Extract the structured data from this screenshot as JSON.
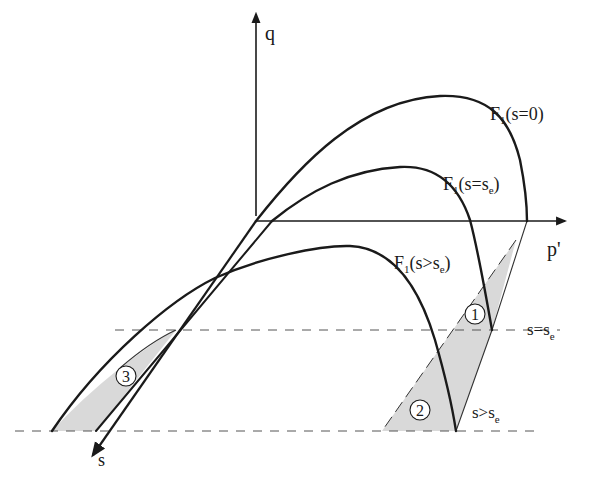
{
  "figure": {
    "type": "yield-surface-diagram",
    "axes": {
      "q_label": "q",
      "p_label": "p'",
      "s_label": "s"
    },
    "curves": [
      {
        "name": "F1(s=0)",
        "label_main": "F",
        "label_sub": "1",
        "label_rest": "(s=0)"
      },
      {
        "name": "F1(s=se)",
        "label_main": "F",
        "label_sub": "1",
        "label_rest_a": "(s=s",
        "label_rest_sub": "e",
        "label_rest_b": ")"
      },
      {
        "name": "F1(s>se)",
        "label_main": "F",
        "label_sub": "1",
        "label_rest_a": "(s>s",
        "label_rest_sub": "e",
        "label_rest_b": ")"
      }
    ],
    "levels": [
      {
        "name": "s=se",
        "text_a": "s=s",
        "text_sub": "e"
      },
      {
        "name": "s>se",
        "text_a": "s>s",
        "text_sub": "e"
      }
    ],
    "regions": [
      {
        "id": "1",
        "label": "1"
      },
      {
        "id": "2",
        "label": "2"
      },
      {
        "id": "3",
        "label": "3"
      }
    ],
    "colors": {
      "line": "#1a1a1a",
      "shade": "#d9d9d9",
      "dash": "#555555"
    }
  }
}
